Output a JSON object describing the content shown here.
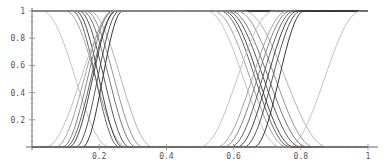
{
  "chart_data": {
    "type": "line",
    "title": "",
    "xlabel": "",
    "ylabel": "",
    "xlim": [
      0,
      1
    ],
    "ylim": [
      0,
      1
    ],
    "grid": false,
    "legend": null,
    "x_ticks": [
      {
        "value": 0.2,
        "label": "0.2"
      },
      {
        "value": 0.4,
        "label": "0.4"
      },
      {
        "value": 0.6,
        "label": "0.6"
      },
      {
        "value": 0.8,
        "label": "0.8"
      },
      {
        "value": 1.0,
        "label": "1"
      }
    ],
    "y_ticks": [
      {
        "value": 0.2,
        "label": "0.2"
      },
      {
        "value": 0.4,
        "label": "0.4"
      },
      {
        "value": 0.6,
        "label": "0.6"
      },
      {
        "value": 0.8,
        "label": "0.8"
      },
      {
        "value": 1.0,
        "label": "1"
      }
    ],
    "series": [
      {
        "name": "g1-down-1",
        "direction": "down",
        "start": 0.03,
        "end": 0.23,
        "color": "#bbbbbb"
      },
      {
        "name": "g1-down-2",
        "direction": "down",
        "start": 0.1,
        "end": 0.28,
        "color": "#999999"
      },
      {
        "name": "g1-down-3",
        "direction": "down",
        "start": 0.12,
        "end": 0.26,
        "color": "#555555"
      },
      {
        "name": "g1-down-4",
        "direction": "down",
        "start": 0.13,
        "end": 0.27,
        "color": "#333333"
      },
      {
        "name": "g1-down-5",
        "direction": "down",
        "start": 0.14,
        "end": 0.29,
        "color": "#444444"
      },
      {
        "name": "g1-down-6",
        "direction": "down",
        "start": 0.15,
        "end": 0.31,
        "color": "#666666"
      },
      {
        "name": "g1-down-7",
        "direction": "down",
        "start": 0.16,
        "end": 0.33,
        "color": "#888888"
      },
      {
        "name": "g1-down-8",
        "direction": "down",
        "start": 0.17,
        "end": 0.36,
        "color": "#aaaaaa"
      },
      {
        "name": "g1-up-1",
        "direction": "up",
        "start": 0.04,
        "end": 0.25,
        "color": "#bbbbbb"
      },
      {
        "name": "g1-up-2",
        "direction": "up",
        "start": 0.07,
        "end": 0.24,
        "color": "#999999"
      },
      {
        "name": "g1-up-3",
        "direction": "up",
        "start": 0.09,
        "end": 0.24,
        "color": "#777777"
      },
      {
        "name": "g1-up-4",
        "direction": "up",
        "start": 0.1,
        "end": 0.25,
        "color": "#555555"
      },
      {
        "name": "g1-up-5",
        "direction": "up",
        "start": 0.11,
        "end": 0.25,
        "color": "#333333"
      },
      {
        "name": "g1-up-6",
        "direction": "up",
        "start": 0.13,
        "end": 0.26,
        "color": "#444444"
      },
      {
        "name": "g1-up-7",
        "direction": "up",
        "start": 0.15,
        "end": 0.27,
        "color": "#222222"
      },
      {
        "name": "g2-down-1",
        "direction": "down",
        "start": 0.52,
        "end": 0.74,
        "color": "#bbbbbb"
      },
      {
        "name": "g2-down-2",
        "direction": "down",
        "start": 0.54,
        "end": 0.76,
        "color": "#999999"
      },
      {
        "name": "g2-down-3",
        "direction": "down",
        "start": 0.56,
        "end": 0.77,
        "color": "#555555"
      },
      {
        "name": "g2-down-4",
        "direction": "down",
        "start": 0.57,
        "end": 0.78,
        "color": "#333333"
      },
      {
        "name": "g2-down-5",
        "direction": "down",
        "start": 0.58,
        "end": 0.8,
        "color": "#444444"
      },
      {
        "name": "g2-down-6",
        "direction": "down",
        "start": 0.59,
        "end": 0.82,
        "color": "#666666"
      },
      {
        "name": "g2-down-7",
        "direction": "down",
        "start": 0.61,
        "end": 0.84,
        "color": "#888888"
      },
      {
        "name": "g2-down-8",
        "direction": "down",
        "start": 0.63,
        "end": 0.88,
        "color": "#aaaaaa"
      },
      {
        "name": "g2-up-1",
        "direction": "up",
        "start": 0.5,
        "end": 0.72,
        "color": "#bbbbbb"
      },
      {
        "name": "g2-up-2",
        "direction": "up",
        "start": 0.55,
        "end": 0.76,
        "color": "#999999"
      },
      {
        "name": "g2-up-3",
        "direction": "up",
        "start": 0.57,
        "end": 0.77,
        "color": "#777777"
      },
      {
        "name": "g2-up-4",
        "direction": "up",
        "start": 0.59,
        "end": 0.78,
        "color": "#555555"
      },
      {
        "name": "g2-up-5",
        "direction": "up",
        "start": 0.61,
        "end": 0.79,
        "color": "#333333"
      },
      {
        "name": "g2-up-6",
        "direction": "up",
        "start": 0.63,
        "end": 0.8,
        "color": "#444444"
      },
      {
        "name": "g2-up-7",
        "direction": "up",
        "start": 0.66,
        "end": 0.81,
        "color": "#222222"
      },
      {
        "name": "g2-up-8",
        "direction": "up",
        "start": 0.76,
        "end": 0.98,
        "color": "#bbbbbb"
      }
    ]
  },
  "layout": {
    "plot_left": 32,
    "plot_right": 368,
    "plot_top": 11,
    "plot_bottom": 147
  }
}
